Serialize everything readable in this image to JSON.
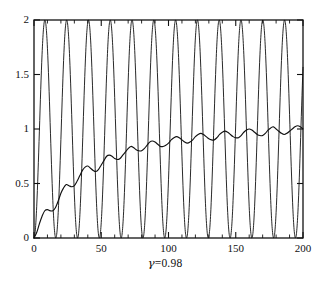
{
  "caption": {
    "symbol": "γ",
    "relation": "=",
    "value": "0.98",
    "full": "γ=0.98"
  },
  "axes": {
    "x_ticks": [
      "0",
      "50",
      "100",
      "150",
      "200"
    ],
    "y_ticks": [
      "0",
      "0.5",
      "1",
      "1.5",
      "2"
    ],
    "x_minor_step": 10,
    "frame": "box",
    "tick_direction": "in"
  },
  "chart_data": {
    "type": "line",
    "title": "",
    "subtitle": "",
    "xlabel": "",
    "ylabel": "",
    "annotation": "γ=0.98",
    "xlim": [
      0,
      200
    ],
    "ylim": [
      0,
      2
    ],
    "xticks": [
      0,
      50,
      100,
      150,
      200
    ],
    "yticks": [
      0,
      0.5,
      1,
      1.5,
      2
    ],
    "xminor_ticks": [
      10,
      20,
      30,
      40,
      60,
      70,
      80,
      90,
      110,
      120,
      130,
      140,
      160,
      170,
      180,
      190
    ],
    "grid": false,
    "legend": "none",
    "line_color": "#111111",
    "line_width": 0.9,
    "series": [
      {
        "name": "fast-oscillation",
        "description": "rapid sinusoidal response spanning the full range 0 to 2",
        "period": 16.2,
        "min": 0,
        "max": 2,
        "mean": 1,
        "amplitude": 1,
        "phase_zero_at_x": 0,
        "n_peaks_visible": 13,
        "model": "1 - cos(2*pi*x/16.2)",
        "x": [
          0,
          4,
          8,
          12,
          16,
          20,
          24,
          28,
          32,
          36,
          40,
          44,
          48,
          52,
          56,
          60,
          64,
          68,
          72,
          76,
          80,
          84,
          88,
          92,
          96,
          100,
          104,
          108,
          112,
          116,
          120,
          124,
          128,
          132,
          136,
          140,
          144,
          148,
          152,
          156,
          160,
          164,
          168,
          172,
          176,
          180,
          184,
          188,
          192,
          196,
          200
        ],
        "values": [
          0.0,
          1.0,
          1.93,
          1.43,
          0.28,
          0.15,
          1.2,
          1.99,
          1.24,
          0.13,
          0.3,
          1.47,
          1.92,
          0.97,
          0.02,
          0.51,
          1.68,
          1.77,
          0.72,
          0.0,
          0.74,
          1.84,
          1.58,
          0.48,
          0.03,
          0.99,
          1.95,
          1.33,
          0.25,
          0.17,
          1.23,
          1.99,
          1.09,
          0.09,
          0.37,
          1.54,
          1.87,
          0.86,
          0.01,
          0.6,
          1.76,
          1.69,
          0.62,
          0.01,
          0.83,
          1.89,
          1.47,
          0.38,
          0.06,
          1.11,
          1.98
        ]
      },
      {
        "name": "slow-envelope",
        "description": "slowly rising rippled curve starting at 0 and saturating near 1",
        "start_value": 0,
        "end_value": 1.03,
        "saturation_level": 1.0,
        "ripple_period": 16.2,
        "ripple_amplitude_start": 0.06,
        "ripple_amplitude_end": 0.08,
        "x": [
          0,
          2,
          4,
          6,
          8,
          10,
          12,
          14,
          16,
          18,
          20,
          22,
          24,
          26,
          28,
          30,
          32,
          34,
          36,
          38,
          40,
          42,
          44,
          46,
          48,
          50,
          52,
          54,
          56,
          58,
          60,
          62,
          64,
          66,
          68,
          70,
          72,
          74,
          76,
          78,
          80,
          82,
          84,
          86,
          88,
          90,
          92,
          94,
          96,
          98,
          100,
          102,
          104,
          106,
          108,
          110,
          112,
          114,
          116,
          118,
          120,
          122,
          124,
          126,
          128,
          130,
          132,
          134,
          136,
          138,
          140,
          142,
          144,
          146,
          148,
          150,
          152,
          154,
          156,
          158,
          160,
          162,
          164,
          166,
          168,
          170,
          172,
          174,
          176,
          178,
          180,
          182,
          184,
          186,
          188,
          190,
          192,
          194,
          196,
          198,
          200
        ],
        "values": [
          0.0,
          0.05,
          0.13,
          0.2,
          0.25,
          0.26,
          0.25,
          0.25,
          0.28,
          0.34,
          0.41,
          0.46,
          0.49,
          0.48,
          0.47,
          0.48,
          0.52,
          0.57,
          0.62,
          0.65,
          0.66,
          0.64,
          0.62,
          0.61,
          0.63,
          0.67,
          0.71,
          0.75,
          0.76,
          0.75,
          0.73,
          0.72,
          0.73,
          0.76,
          0.79,
          0.82,
          0.84,
          0.83,
          0.81,
          0.8,
          0.8,
          0.82,
          0.85,
          0.88,
          0.89,
          0.88,
          0.86,
          0.84,
          0.84,
          0.85,
          0.87,
          0.9,
          0.92,
          0.93,
          0.92,
          0.9,
          0.88,
          0.87,
          0.88,
          0.9,
          0.93,
          0.95,
          0.96,
          0.95,
          0.93,
          0.91,
          0.9,
          0.9,
          0.92,
          0.95,
          0.97,
          0.98,
          0.97,
          0.95,
          0.93,
          0.92,
          0.92,
          0.94,
          0.97,
          0.99,
          1.0,
          0.99,
          0.97,
          0.95,
          0.94,
          0.94,
          0.96,
          0.99,
          1.01,
          1.02,
          1.0,
          0.98,
          0.96,
          0.95,
          0.96,
          0.98,
          1.0,
          1.02,
          1.03,
          1.02,
          1.0
        ]
      }
    ]
  }
}
